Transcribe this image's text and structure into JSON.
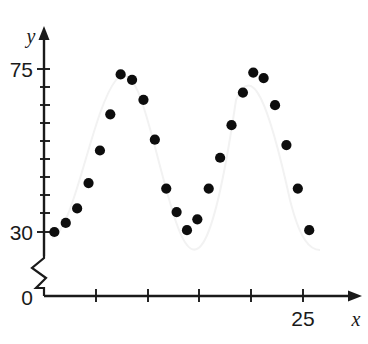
{
  "chart_data": {
    "type": "scatter",
    "title": "",
    "xlabel": "x",
    "ylabel": "y",
    "xlim": [
      0,
      29.5
    ],
    "ylim": [
      30,
      80
    ],
    "y_axis_break": true,
    "y_axis_break_note": "axis broken between 0 and 30",
    "grid": false,
    "legend": false,
    "x_tick_labels": [
      "25"
    ],
    "x_tick_values": [
      5,
      10,
      15,
      20,
      25
    ],
    "y_tick_labels": [
      "0",
      "30",
      "75"
    ],
    "y_tick_values": [
      30,
      35,
      40,
      45,
      50,
      55,
      60,
      65,
      70,
      75
    ],
    "marker": "filled-circle",
    "marker_color": "#0d0d0d",
    "points": [
      {
        "x": 1.0,
        "y": 30.0
      },
      {
        "x": 2.1,
        "y": 32.5
      },
      {
        "x": 3.2,
        "y": 36.5
      },
      {
        "x": 4.3,
        "y": 43.5
      },
      {
        "x": 5.4,
        "y": 52.5
      },
      {
        "x": 6.4,
        "y": 62.5
      },
      {
        "x": 7.4,
        "y": 73.5
      },
      {
        "x": 8.5,
        "y": 72.0
      },
      {
        "x": 9.6,
        "y": 66.5
      },
      {
        "x": 10.7,
        "y": 55.5
      },
      {
        "x": 11.8,
        "y": 42.0
      },
      {
        "x": 12.8,
        "y": 35.5
      },
      {
        "x": 13.8,
        "y": 30.5
      },
      {
        "x": 14.8,
        "y": 33.5
      },
      {
        "x": 15.9,
        "y": 42.0
      },
      {
        "x": 17.0,
        "y": 50.5
      },
      {
        "x": 18.1,
        "y": 59.5
      },
      {
        "x": 19.2,
        "y": 68.5
      },
      {
        "x": 20.2,
        "y": 74.0
      },
      {
        "x": 21.2,
        "y": 72.5
      },
      {
        "x": 22.3,
        "y": 65.0
      },
      {
        "x": 23.4,
        "y": 54.0
      },
      {
        "x": 24.5,
        "y": 42.0
      },
      {
        "x": 25.6,
        "y": 30.5
      }
    ],
    "annotations": []
  },
  "axes": {
    "y_label": "y",
    "x_label": "x",
    "y_top_tick_label": "75",
    "y_low_tick_label": "30",
    "origin_label": "0",
    "x_far_tick_label": "25"
  },
  "page": {
    "top_fragment": ""
  }
}
